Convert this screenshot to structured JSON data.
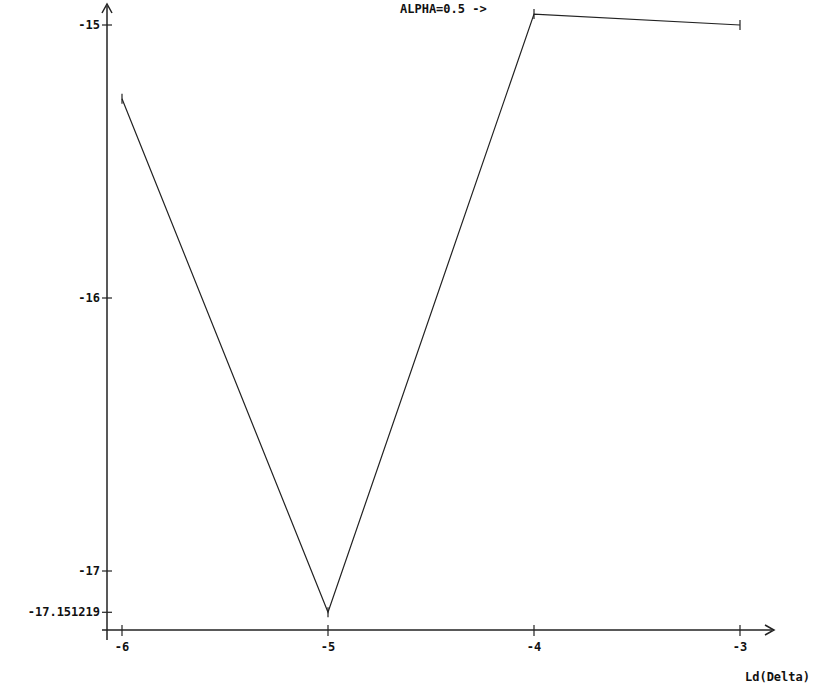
{
  "chart_data": {
    "type": "line",
    "title": "",
    "annotation": "ALPHA=0.5 ->",
    "xlabel": "Ld(Delta)",
    "ylabel": "",
    "x": [
      -6,
      -5,
      -4,
      -3
    ],
    "series": [
      {
        "name": "ALPHA=0.5",
        "values": [
          -15.27,
          -17.151219,
          -14.96,
          -15.0
        ]
      }
    ],
    "x_ticks": [
      "-6",
      "-5",
      "-4",
      "-3"
    ],
    "y_ticks": [
      "-15",
      "-16",
      "-17",
      "-17.151219"
    ],
    "xlim": [
      -6.07,
      -2.84
    ],
    "ylim": [
      -17.22,
      -14.91
    ],
    "grid": false,
    "legend": "none",
    "line_color": "#222222"
  }
}
